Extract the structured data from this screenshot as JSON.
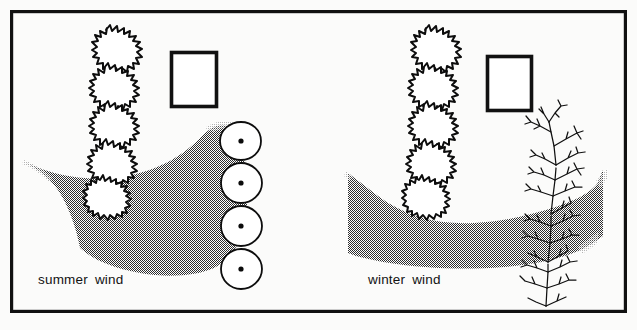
{
  "figure": {
    "background_color": "#fbfbfa",
    "ink_color": "#0d0d0d",
    "frame": {
      "color": "#111111",
      "stroke_width": 3.2,
      "x": 10,
      "y": 10,
      "width": 617,
      "height": 303
    },
    "halftone": {
      "color": "#2b2b2b",
      "pitch_px": 2,
      "coverage": "≈50%",
      "description": "stippled dot screen indicating wind flow"
    }
  },
  "panels": [
    {
      "id": "summer",
      "label": "summer wind",
      "label_x": 38,
      "label_y": 284,
      "wind_pattern": "deflected",
      "wind_description": "crescent-shaped flow curving down and under, blocked by evergreen screen",
      "planting_type": "evergreen",
      "evergreen_crowns": 5,
      "plan_circles": 4,
      "plan_circle_has_dot": true,
      "building_count": 1,
      "building": {
        "x": 170,
        "y": 51,
        "width": 48,
        "height": 57
      }
    },
    {
      "id": "winter",
      "label": "winter wind",
      "label_x": 368,
      "label_y": 284,
      "wind_pattern": "penetrating",
      "wind_description": "broad horizontal band passing straight through bare deciduous screen",
      "planting_type": "deciduous",
      "evergreen_crowns": 5,
      "deciduous_shrubs": 4,
      "building_count": 1,
      "building": {
        "x": 486,
        "y": 55,
        "width": 47,
        "height": 57
      }
    }
  ],
  "legend": {
    "symbols": [
      {
        "name": "spiky-crown",
        "meaning": "evergreen tree, elevation/plan symbol"
      },
      {
        "name": "circle-with-dot",
        "meaning": "tree in plan view"
      },
      {
        "name": "open-rectangle",
        "meaning": "building footprint"
      },
      {
        "name": "bare-branching",
        "meaning": "deciduous tree, winter condition"
      },
      {
        "name": "dot-screen",
        "meaning": "wind flow"
      }
    ]
  }
}
